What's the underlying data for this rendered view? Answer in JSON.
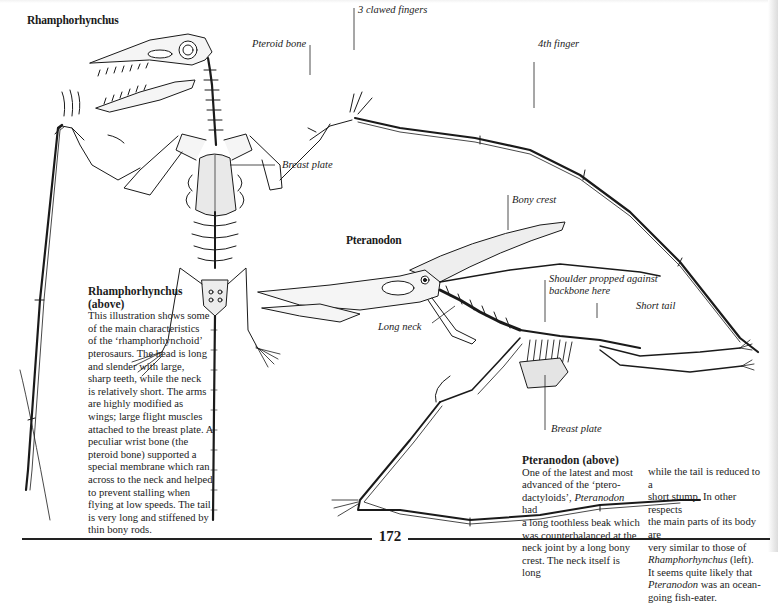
{
  "page": {
    "number": "172"
  },
  "rhamphorhynchus": {
    "heading": "Rhamphorhynchus",
    "labels": {
      "claws": "3 clawed fingers",
      "pteroid": "Pteroid bone",
      "fourth_finger": "4th finger",
      "breast_plate": "Breast plate"
    },
    "caption": {
      "title_line1": "Rhamphorhynchus",
      "title_line2": "(above)",
      "lines": [
        "This illustration shows some",
        "of the main characteristics",
        "of the ‘rhamphorhynchoid’",
        "pterosaurs. The head is long",
        "and slender with large,",
        "sharp teeth, while the neck",
        "is relatively short. The arms",
        "are highly modified as",
        "wings; large flight muscles",
        "attached to the breast plate. A",
        "peculiar wrist bone (the",
        "pteroid bone) supported a",
        "special membrane which ran",
        "across to the neck and helped",
        "to prevent stalling when",
        "flying at low speeds. The tail",
        "is very long and stiffened by",
        "thin bony rods."
      ]
    }
  },
  "pteranodon": {
    "heading": "Pteranodon",
    "labels": {
      "bony_crest": "Bony crest",
      "shoulder_line1": "Shoulder propped against",
      "shoulder_line2": "backbone here",
      "short_tail": "Short tail",
      "long_neck": "Long neck",
      "breast_plate": "Breast plate"
    },
    "caption": {
      "title": "Pteranodon (above)",
      "col1": [
        "One of the latest and most",
        "advanced of the ‘ptero-",
        "dactyloids’, ",
        "a long toothless beak which",
        "was counterbalanced at the",
        "neck joint by a long bony",
        "crest. The neck itself is long"
      ],
      "col1_italic_word": "Pteranodon",
      "col1_line3_tail": " had",
      "col2": [
        "while the tail is reduced to a",
        "short stump. In other respects",
        "the main parts of its body are",
        "very similar to those of"
      ],
      "col2_italic_ref": "Rhamphorhynchus",
      "col2_ref_tail": " (left).",
      "col2_line6": "It seems quite likely that",
      "col2_italic_name": "Pteranodon",
      "col2_line7_tail": " was an ocean-",
      "col2_line8": "going fish-eater."
    }
  },
  "colors": {
    "ink": "#1a1a1a",
    "bone_fill": "#f4f4f4",
    "shade": "#cfcfcf"
  }
}
